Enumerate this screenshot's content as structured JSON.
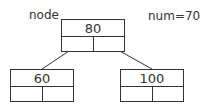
{
  "labels": {
    "node": "node",
    "num": "num=70"
  },
  "tree": {
    "root": {
      "value": "80"
    },
    "left": {
      "value": "60"
    },
    "right": {
      "value": "100"
    }
  },
  "colors": {
    "stroke": "#333333",
    "background": "#ffffff"
  }
}
